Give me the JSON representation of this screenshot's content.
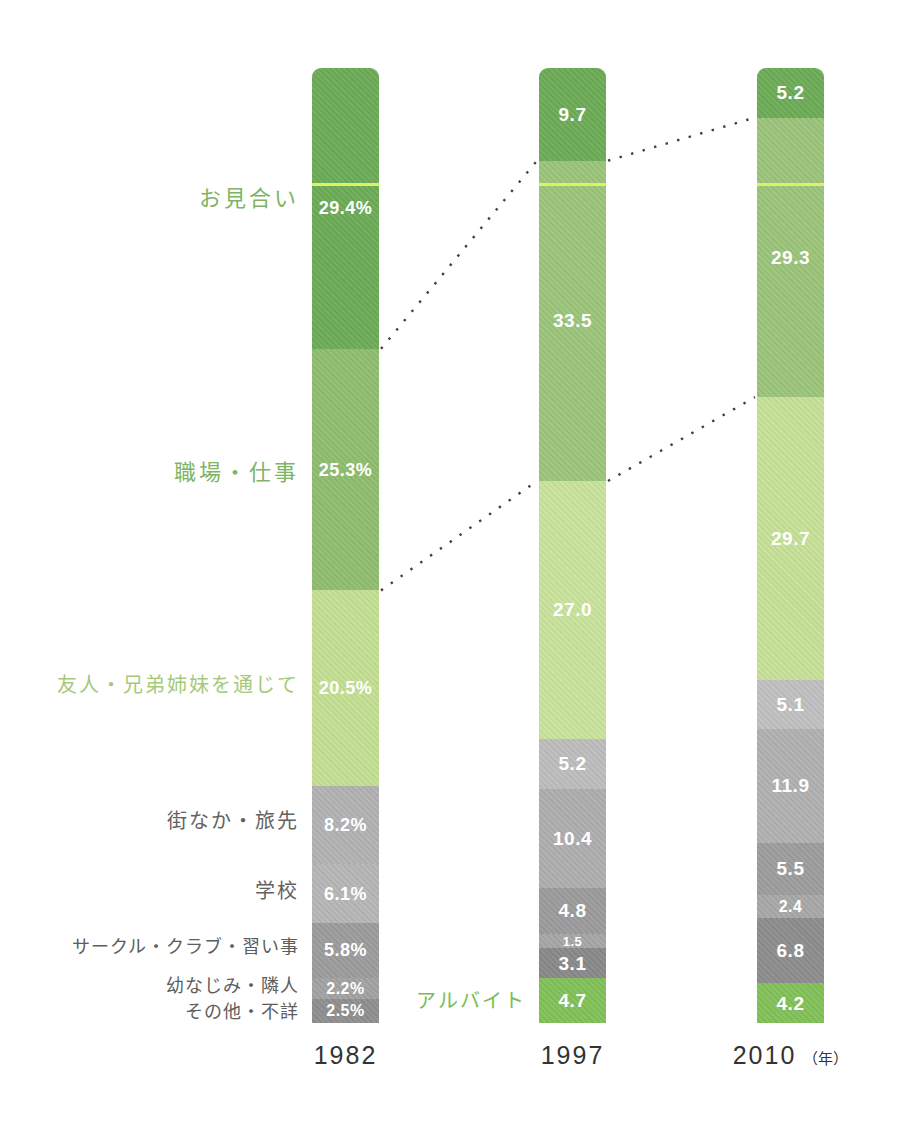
{
  "chart_data": {
    "type": "bar",
    "subtype": "100-percent-stacked-column",
    "unit": "%",
    "grid": false,
    "legend": "left-side category labels",
    "categories": [
      "1982",
      "1997",
      "2010"
    ],
    "x_axis_suffix": "（年）",
    "series": [
      {
        "key": "omiai",
        "name": "お見合い",
        "values": [
          29.4,
          9.7,
          5.2
        ]
      },
      {
        "key": "workplace-work",
        "name": "職場・仕事",
        "values": [
          25.3,
          33.5,
          29.3
        ]
      },
      {
        "key": "friends-siblings",
        "name": "友人・兄弟姉妹を通じて",
        "values": [
          20.5,
          27.0,
          29.7
        ]
      },
      {
        "key": "town-travel",
        "name": "街なか・旅先",
        "values": [
          8.2,
          5.2,
          5.1
        ]
      },
      {
        "key": "school",
        "name": "学校",
        "values": [
          6.1,
          10.4,
          11.9
        ]
      },
      {
        "key": "circle-club-lessons",
        "name": "サークル・クラブ・習い事",
        "values": [
          5.8,
          4.8,
          5.5
        ]
      },
      {
        "key": "childhood-friend-neighbor",
        "name": "幼なじみ・隣人",
        "values": [
          2.2,
          1.5,
          2.4
        ]
      },
      {
        "key": "other-unknown",
        "name": "その他・不詳",
        "values": [
          2.5,
          3.1,
          6.8
        ]
      },
      {
        "key": "part-time-job",
        "name": "アルバイト",
        "values": [
          null,
          4.7,
          4.2
        ]
      }
    ],
    "bars": [
      {
        "year": "1982",
        "segments": [
          {
            "name": "お見合い",
            "value": 29.4,
            "display": "29.4%",
            "color": "#6dac57"
          },
          {
            "name": "職場・仕事",
            "value": 25.3,
            "display": "25.3%",
            "color": "#8fbe70"
          },
          {
            "name": "友人・兄弟姉妹を通じて",
            "value": 20.5,
            "display": "20.5%",
            "color": "#c4df93"
          },
          {
            "name": "街なか・旅先",
            "value": 8.2,
            "display": "8.2%",
            "color": "#b2b2b2"
          },
          {
            "name": "学校",
            "value": 6.1,
            "display": "6.1%",
            "color": "#b6b6b6"
          },
          {
            "name": "サークル・クラブ・習い事",
            "value": 5.8,
            "display": "5.8%",
            "color": "#9c9c9c"
          },
          {
            "name": "幼なじみ・隣人",
            "value": 2.2,
            "display": "2.2%",
            "color": "#a2a2a2"
          },
          {
            "name": "その他・不詳",
            "value": 2.5,
            "display": "2.5%",
            "color": "#8f8f8f"
          }
        ]
      },
      {
        "year": "1997",
        "segments": [
          {
            "name": "お見合い",
            "value": 9.7,
            "display": "9.7",
            "color": "#6dac57"
          },
          {
            "name": "職場・仕事",
            "value": 33.5,
            "display": "33.5",
            "color": "#9cc57b"
          },
          {
            "name": "友人・兄弟姉妹を通じて",
            "value": 27.0,
            "display": "27.0",
            "color": "#c9e39c"
          },
          {
            "name": "街なか・旅先",
            "value": 5.2,
            "display": "5.2",
            "color": "#bdbdbd"
          },
          {
            "name": "学校",
            "value": 10.4,
            "display": "10.4",
            "color": "#aeaeae"
          },
          {
            "name": "サークル・クラブ・習い事",
            "value": 4.8,
            "display": "4.8",
            "color": "#9b9b9b"
          },
          {
            "name": "幼なじみ・隣人",
            "value": 1.5,
            "display": "1.5",
            "color": "#a6a6a6"
          },
          {
            "name": "その他・不詳",
            "value": 3.1,
            "display": "3.1",
            "color": "#898989"
          },
          {
            "name": "アルバイト",
            "value": 4.7,
            "display": "4.7",
            "color": "#82c158"
          }
        ]
      },
      {
        "year": "2010",
        "segments": [
          {
            "name": "お見合い",
            "value": 5.2,
            "display": "5.2",
            "color": "#6dac57"
          },
          {
            "name": "職場・仕事",
            "value": 29.3,
            "display": "29.3",
            "color": "#9cc47b"
          },
          {
            "name": "友人・兄弟姉妹を通じて",
            "value": 29.7,
            "display": "29.7",
            "color": "#c6e197"
          },
          {
            "name": "街なか・旅先",
            "value": 5.1,
            "display": "5.1",
            "color": "#c0c0c0"
          },
          {
            "name": "学校",
            "value": 11.9,
            "display": "11.9",
            "color": "#b1b1b1"
          },
          {
            "name": "サークル・クラブ・習い事",
            "value": 5.5,
            "display": "5.5",
            "color": "#9d9d9d"
          },
          {
            "name": "幼なじみ・隣人",
            "value": 2.4,
            "display": "2.4",
            "color": "#a8a8a8"
          },
          {
            "name": "その他・不詳",
            "value": 6.8,
            "display": "6.8",
            "color": "#8d8d8d"
          },
          {
            "name": "アルバイト",
            "value": 4.2,
            "display": "4.2",
            "color": "#82c158"
          }
        ]
      }
    ],
    "category_labels": [
      {
        "text": "お見合い",
        "color": "#7eb463",
        "bar": 0,
        "seg": 0,
        "cls": "lg",
        "dy": -12
      },
      {
        "text": "職場・仕事",
        "color": "#7eb463",
        "bar": 0,
        "seg": 1,
        "cls": "lg",
        "dy": 0
      },
      {
        "text": "友人・兄弟姉妹を通じて",
        "color": "#a5ca7c",
        "bar": 0,
        "seg": 2,
        "cls": "md",
        "dy": -5
      },
      {
        "text": "街なか・旅先",
        "color": "#626262",
        "bar": 0,
        "seg": 3,
        "cls": "md",
        "dy": -6
      },
      {
        "text": "学校",
        "color": "#626262",
        "bar": 0,
        "seg": 4,
        "cls": "md",
        "dy": -5
      },
      {
        "text": "サークル・クラブ・習い事",
        "color": "#5d5d5d",
        "bar": 0,
        "seg": 5,
        "cls": "sm",
        "dy": -5
      },
      {
        "text": "幼なじみ・隣人",
        "color": "#5d5d5d",
        "bar": 0,
        "seg": 6,
        "cls": "sm",
        "dy": -5
      },
      {
        "text": "その他・不詳",
        "color": "#5d5d5d",
        "bar": 0,
        "seg": 7,
        "cls": "sm",
        "dy": -1
      },
      {
        "text": "アルバイト",
        "color": "#79bd52",
        "bar": 1,
        "seg": 8,
        "cls": "md",
        "dy": -2
      }
    ],
    "value_text_color": "#ffffff",
    "marker_line": {
      "color": "#def162"
    },
    "connector": {
      "color": "#404040",
      "style": "dotted",
      "after_segment": [
        0,
        1
      ]
    }
  }
}
